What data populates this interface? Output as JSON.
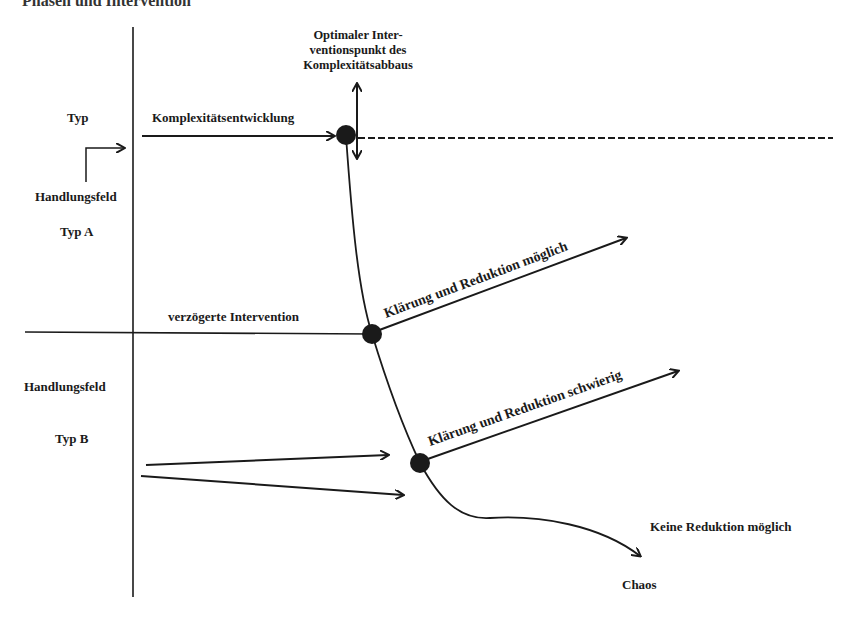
{
  "title": "Phasen und Intervention",
  "annotations": {
    "optimal_point": [
      "Optimaler Inter-",
      "ventionspunkt des",
      "Komplexitätsabbaus"
    ],
    "complexity": "Komplexitätsentwicklung",
    "delayed": "verzögerte Intervention",
    "possible": "Klärung und Reduktion möglich",
    "difficult": "Klärung und Reduktion schwierig",
    "no_reduction": "Keine Reduktion möglich",
    "chaos": "Chaos"
  },
  "left_labels": {
    "typ": "Typ",
    "field_a": "Handlungsfeld",
    "typ_a": "Typ A",
    "field_b": "Handlungsfeld",
    "typ_b": "Typ B"
  },
  "colors": {
    "ink": "#1a1a1a",
    "background": "#ffffff"
  }
}
